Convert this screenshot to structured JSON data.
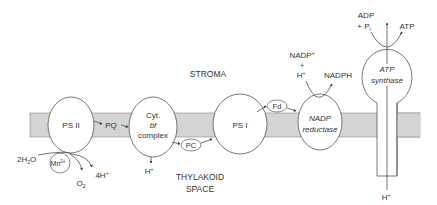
{
  "diagram": {
    "regions": {
      "stroma": "STROMA",
      "thylakoid_space_line1": "THYLAKOID",
      "thylakoid_space_line2": "SPACE"
    },
    "complexes": {
      "ps2": "PS II",
      "cyt_line1": "Cyt.",
      "cyt_line2": "bf",
      "cyt_line3": "complex",
      "ps1": "PS I",
      "nadp_line1": "NADP",
      "nadp_line2": "reductase",
      "atp_line1": "ATP",
      "atp_line2": "synthase"
    },
    "carriers": {
      "pq": "PQ",
      "pc": "PC",
      "fd": "Fd",
      "mn": "Mn",
      "mn_sup": "2+"
    },
    "molecules": {
      "water_pre": "2H",
      "water_sub": "2",
      "water_post": "O",
      "oxygen": "O",
      "oxygen_sub": "2",
      "protons_4": "4H",
      "h_plus_sup": "+",
      "h_cyt": "H",
      "nadp_plus": "NADP",
      "plus_sign": "+",
      "h_nadp": "H",
      "nadph": "NADPH",
      "adp": "ADP",
      "pi_prefix": "+ P",
      "pi_sub": "i",
      "atp": "ATP",
      "h_atp": "H"
    },
    "colors": {
      "membrane": "#d4d4d4",
      "stroke": "#555555",
      "text": "#333333"
    }
  }
}
